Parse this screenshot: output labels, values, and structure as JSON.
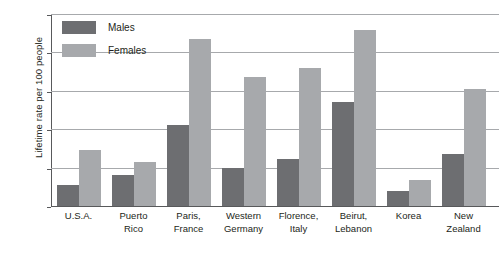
{
  "chart_data": {
    "type": "bar",
    "title": "",
    "subtitle": "",
    "xlabel": "",
    "ylabel": "Lifetime rate per 100 people",
    "ylim": [
      0,
      25
    ],
    "yticks": [
      0,
      5,
      10,
      15,
      20,
      25
    ],
    "ytick_labels": [
      "0",
      "5",
      "10",
      "15",
      "20",
      "25"
    ],
    "gridlines": [
      5,
      10,
      15,
      20,
      25
    ],
    "grid": true,
    "legend_position": "top-left",
    "categories": [
      "U.S.A.",
      "Puerto Rico",
      "Paris, France",
      "Western Germany",
      "Florence, Italy",
      "Beirut, Lebanon",
      "Korea",
      "New Zealand"
    ],
    "category_lines": [
      [
        "U.S.A.",
        ""
      ],
      [
        "Puerto",
        "Rico"
      ],
      [
        "Paris,",
        "France"
      ],
      [
        "Western",
        "Germany"
      ],
      [
        "Florence,",
        "Italy"
      ],
      [
        "Beirut,",
        "Lebanon"
      ],
      [
        "Korea",
        ""
      ],
      [
        "New",
        "Zealand"
      ]
    ],
    "series": [
      {
        "name": "Males",
        "color": "#6d6e71",
        "values": [
          2.8,
          4.0,
          10.5,
          4.9,
          6.1,
          13.6,
          2.0,
          6.8
        ]
      },
      {
        "name": "Females",
        "color": "#a7a9ac",
        "values": [
          7.3,
          5.7,
          21.8,
          16.8,
          18.0,
          22.9,
          3.4,
          15.2
        ]
      }
    ]
  }
}
